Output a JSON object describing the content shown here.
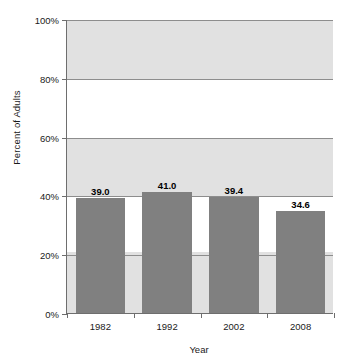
{
  "chart_data": {
    "type": "bar",
    "title": "",
    "subtitle": "",
    "xlabel": "Year",
    "ylabel": "Percent of Adults",
    "categories": [
      "1982",
      "1992",
      "2002",
      "2008"
    ],
    "values": [
      39.0,
      41.0,
      39.4,
      34.6
    ],
    "data_labels": [
      "39.0",
      "41.0",
      "39.4",
      "34.6"
    ],
    "ylim": [
      0,
      100
    ],
    "ytick_values": [
      0,
      20,
      40,
      60,
      80,
      100
    ],
    "ytick_labels": [
      "0%",
      "20%",
      "40%",
      "60%",
      "80%",
      "100%"
    ],
    "grid": true,
    "legend": null,
    "bar_color": "#808080",
    "band_color": "#e1e1e1",
    "axis_color": "#6e6e6e",
    "gridline_color": "#8d8d8d",
    "background_bands": [
      {
        "from": 0,
        "to": 21
      },
      {
        "from": 40,
        "to": 60
      },
      {
        "from": 80,
        "to": 100
      }
    ]
  },
  "footer": {
    "cutoff_text": ""
  }
}
